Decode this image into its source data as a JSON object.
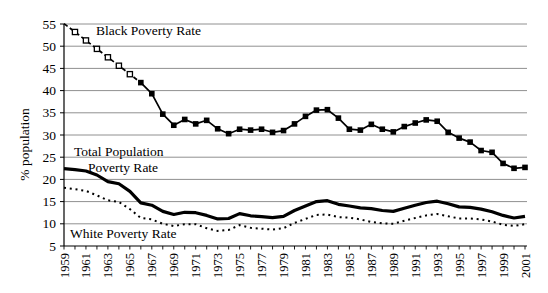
{
  "figure": {
    "ylabel": "% population",
    "annotations": {
      "black": "Black Poverty Rate",
      "total_line1": "Total Population",
      "total_line2": "Poverty Rate",
      "white": "White Poverty Rate"
    }
  },
  "chart_data": {
    "type": "line",
    "title": "",
    "xlabel": "",
    "ylabel": "% population",
    "ylim": [
      5,
      55
    ],
    "yticks": [
      5,
      10,
      15,
      20,
      25,
      30,
      35,
      40,
      45,
      50,
      55
    ],
    "grid": "horizontal",
    "legend_position": "in-plot text labels",
    "x": [
      1959,
      1960,
      1961,
      1962,
      1963,
      1964,
      1965,
      1966,
      1967,
      1968,
      1969,
      1970,
      1971,
      1972,
      1973,
      1974,
      1975,
      1976,
      1977,
      1978,
      1979,
      1980,
      1981,
      1982,
      1983,
      1984,
      1985,
      1986,
      1987,
      1988,
      1989,
      1990,
      1991,
      1992,
      1993,
      1994,
      1995,
      1996,
      1997,
      1998,
      1999,
      2000,
      2001
    ],
    "xtick_labels": [
      "1959",
      "1961",
      "1963",
      "1965",
      "1967",
      "1969",
      "1971",
      "1973",
      "1975",
      "1977",
      "1979",
      "1981",
      "1983",
      "1985",
      "1987",
      "1989",
      "1991",
      "1993",
      "1995",
      "1997",
      "1999",
      "2001"
    ],
    "series": [
      {
        "name": "Black Poverty Rate",
        "marker": "square",
        "line": "solid; dashed with open markers for interpolated years 1960-1965",
        "open_marker_indices": [
          1,
          2,
          3,
          4,
          5,
          6
        ],
        "values": [
          55.1,
          53.2,
          51.3,
          49.4,
          47.5,
          45.6,
          43.7,
          41.8,
          39.3,
          34.7,
          32.2,
          33.5,
          32.5,
          33.3,
          31.4,
          30.3,
          31.3,
          31.1,
          31.3,
          30.6,
          31.0,
          32.5,
          34.2,
          35.6,
          35.7,
          33.8,
          31.3,
          31.1,
          32.4,
          31.3,
          30.7,
          31.9,
          32.7,
          33.4,
          33.1,
          30.6,
          29.3,
          28.4,
          26.5,
          26.1,
          23.6,
          22.5,
          22.7
        ]
      },
      {
        "name": "Total Population Poverty Rate",
        "marker": "none",
        "line": "solid-thick",
        "values": [
          22.4,
          22.2,
          21.9,
          21.0,
          19.5,
          19.0,
          17.3,
          14.7,
          14.2,
          12.8,
          12.1,
          12.6,
          12.5,
          11.9,
          11.1,
          11.2,
          12.3,
          11.8,
          11.6,
          11.4,
          11.7,
          13.0,
          14.0,
          15.0,
          15.2,
          14.4,
          14.0,
          13.6,
          13.4,
          13.0,
          12.8,
          13.5,
          14.2,
          14.8,
          15.1,
          14.5,
          13.8,
          13.7,
          13.3,
          12.7,
          11.9,
          11.3,
          11.7
        ]
      },
      {
        "name": "White Poverty Rate",
        "marker": "none",
        "line": "dotted",
        "values": [
          18.1,
          17.8,
          17.4,
          16.4,
          15.3,
          14.9,
          13.3,
          11.3,
          11.0,
          10.0,
          9.5,
          9.9,
          9.9,
          9.0,
          8.4,
          8.6,
          9.7,
          9.1,
          8.9,
          8.7,
          9.0,
          10.2,
          11.1,
          12.0,
          12.1,
          11.5,
          11.4,
          11.0,
          10.4,
          10.1,
          10.0,
          10.7,
          11.3,
          11.9,
          12.2,
          11.7,
          11.2,
          11.2,
          11.0,
          10.5,
          9.8,
          9.5,
          9.9
        ]
      }
    ],
    "colors": {
      "series": "#000000",
      "grid": "#909090",
      "background": "#ffffff"
    }
  }
}
